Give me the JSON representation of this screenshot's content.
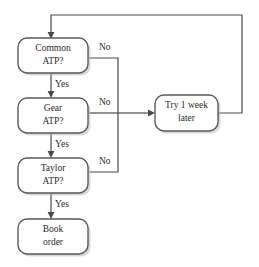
{
  "diagram": {
    "colors": {
      "background": "#ffffff",
      "box_stroke": "#5a5a5a",
      "box_fill": "#ffffff",
      "box_shadow": "#b9b9b9",
      "connector": "#4a4a4a",
      "text": "#2b2b2b"
    },
    "nodes": [
      {
        "id": "common-atp",
        "line1": "Common",
        "line2": "ATP?",
        "shape": "rounded-rectangle"
      },
      {
        "id": "gear-atp",
        "line1": "Gear",
        "line2": "ATP?",
        "shape": "rounded-rectangle"
      },
      {
        "id": "taylor-atp",
        "line1": "Taylor",
        "line2": "ATP?",
        "shape": "rounded-rectangle"
      },
      {
        "id": "book-order",
        "line1": "Book",
        "line2": "order",
        "shape": "rounded-rectangle"
      },
      {
        "id": "try-later",
        "line1": "Try 1 week",
        "line2": "later",
        "shape": "rounded-rectangle"
      }
    ],
    "edge_labels": {
      "no_common": "No",
      "no_gear": "No",
      "no_taylor": "No",
      "yes_common": "Yes",
      "yes_gear": "Yes",
      "yes_taylor": "Yes"
    }
  }
}
